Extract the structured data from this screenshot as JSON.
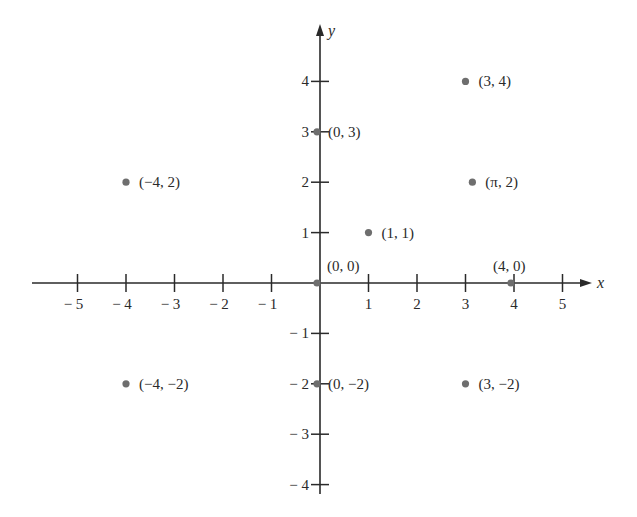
{
  "chart_data": {
    "type": "scatter",
    "title": "",
    "xlabel": "x",
    "ylabel": "y",
    "xlim": [
      -5,
      5
    ],
    "ylim": [
      -4,
      4
    ],
    "grid": false,
    "x_ticks": [
      -5,
      -4,
      -3,
      -2,
      -1,
      1,
      2,
      3,
      4,
      5
    ],
    "y_ticks": [
      -4,
      -3,
      -2,
      -1,
      1,
      2,
      3,
      4
    ],
    "x_tick_labels": [
      "− 5",
      "− 4",
      "− 3",
      "− 2",
      "− 1",
      "1",
      "2",
      "3",
      "4",
      "5"
    ],
    "y_tick_labels": [
      "− 4",
      "− 3",
      "− 2",
      "− 1",
      "1",
      "2",
      "3",
      "4"
    ],
    "points": [
      {
        "x": 3,
        "y": 4,
        "label": "(3, 4)"
      },
      {
        "x": 0,
        "y": 3,
        "label": "(0, 3)"
      },
      {
        "x": -4,
        "y": 2,
        "label": "(−4, 2)"
      },
      {
        "x": 3.14159,
        "y": 2,
        "label": "(π, 2)"
      },
      {
        "x": 1,
        "y": 1,
        "label": "(1, 1)"
      },
      {
        "x": 0,
        "y": 0,
        "label": "(0, 0)"
      },
      {
        "x": 4,
        "y": 0,
        "label": "(4, 0)"
      },
      {
        "x": -4,
        "y": -2,
        "label": "(−4, −2)"
      },
      {
        "x": 0,
        "y": -2,
        "label": "(0, −2)"
      },
      {
        "x": 3,
        "y": -2,
        "label": "(3, −2)"
      }
    ]
  },
  "layout": {
    "origin_px": [
      320,
      283
    ],
    "unit_x_px": 48.5,
    "unit_y_px": 50.4,
    "x_axis_start_px": 32,
    "x_axis_end_px": 592,
    "y_axis_top_px": 24,
    "y_axis_bottom_px": 494
  },
  "colors": {
    "axis": "#2a2a2a",
    "point": "#6e6e6e",
    "background": "#ffffff"
  }
}
